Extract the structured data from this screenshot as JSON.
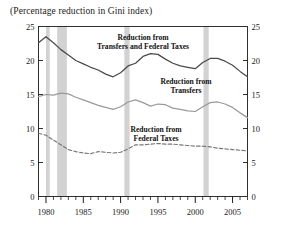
{
  "subtitle": "(Percentage reduction in Gini index)",
  "axis": {
    "y_left_ticks": [
      "25",
      "20",
      "15",
      "10",
      "5",
      "0"
    ],
    "y_right_ticks": [
      "25",
      "20",
      "15",
      "10",
      "5",
      "0"
    ],
    "x_ticks": [
      "1980",
      "1985",
      "1990",
      "1995",
      "2000",
      "2005"
    ]
  },
  "labels": {
    "series1_line1": "Reduction from",
    "series1_line2": "Transfers and Federal Taxes",
    "series2_line1": "Reduction from",
    "series2_line2": "Transfers",
    "series3_line1": "Reduction from",
    "series3_line2": "Federal Taxes"
  },
  "colors": {
    "series_dark": "#4a4a4a",
    "series_mid": "#9a9a9a",
    "series_dashed": "#777777",
    "recession_band": "#d2d2d2",
    "axis": "#1a1a1a"
  },
  "chart_data": {
    "type": "line",
    "title": "",
    "subtitle": "(Percentage reduction in Gini index)",
    "xlabel": "",
    "ylabel": "Percentage reduction in Gini index",
    "xlim": [
      1979,
      2007
    ],
    "ylim": [
      0,
      25
    ],
    "grid": false,
    "legend": "inline-annotations",
    "x": [
      1979,
      1980,
      1981,
      1982,
      1983,
      1984,
      1985,
      1986,
      1987,
      1988,
      1989,
      1990,
      1991,
      1992,
      1993,
      1994,
      1995,
      1996,
      1997,
      1998,
      1999,
      2000,
      2001,
      2002,
      2003,
      2004,
      2005,
      2006,
      2007
    ],
    "series": [
      {
        "name": "Reduction from Transfers and Federal Taxes",
        "style": "solid",
        "color": "#4a4a4a",
        "values": [
          22.6,
          23.5,
          22.6,
          21.6,
          20.8,
          20.0,
          19.5,
          19.0,
          18.6,
          18.0,
          17.6,
          18.2,
          19.2,
          19.6,
          20.6,
          21.0,
          20.9,
          20.2,
          19.6,
          19.2,
          19.0,
          18.8,
          19.7,
          20.3,
          20.3,
          19.9,
          19.3,
          18.4,
          17.6
        ]
      },
      {
        "name": "Reduction from Transfers",
        "style": "solid",
        "color": "#9a9a9a",
        "values": [
          14.7,
          15.0,
          14.9,
          15.2,
          15.1,
          14.6,
          14.2,
          13.8,
          13.4,
          13.1,
          12.8,
          13.2,
          13.9,
          14.2,
          13.8,
          13.3,
          13.6,
          13.5,
          13.0,
          12.8,
          12.6,
          12.5,
          13.2,
          13.8,
          13.9,
          13.6,
          13.1,
          12.3,
          11.6
        ]
      },
      {
        "name": "Reduction from Federal Taxes",
        "style": "dashed",
        "color": "#777777",
        "values": [
          9.3,
          9.0,
          8.3,
          7.6,
          6.9,
          6.6,
          6.4,
          6.3,
          6.6,
          6.5,
          6.4,
          6.5,
          7.0,
          7.6,
          7.6,
          7.7,
          7.8,
          7.7,
          7.7,
          7.6,
          7.5,
          7.4,
          7.4,
          7.3,
          7.1,
          7.0,
          6.9,
          6.8,
          6.7
        ]
      }
    ],
    "recession_bands": [
      {
        "start": 1980.0,
        "end": 1980.5
      },
      {
        "start": 1981.5,
        "end": 1982.8
      },
      {
        "start": 1990.5,
        "end": 1991.2
      },
      {
        "start": 2001.1,
        "end": 2001.8
      }
    ]
  }
}
